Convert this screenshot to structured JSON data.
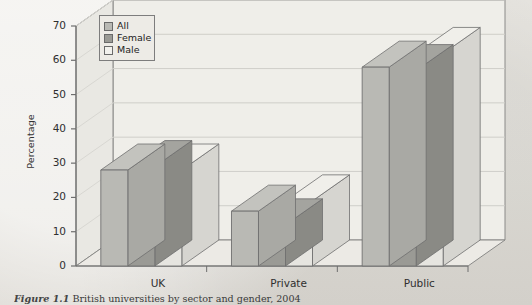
{
  "chart_data": {
    "type": "bar",
    "title": "",
    "xlabel": "",
    "ylabel": "Percentage",
    "categories": [
      "UK",
      "Private",
      "Public"
    ],
    "series": [
      {
        "name": "All",
        "values": [
          28,
          16,
          58
        ],
        "color": "#b9b9b4"
      },
      {
        "name": "Female",
        "values": [
          29,
          12,
          57
        ],
        "color": "#9a9a95"
      },
      {
        "name": "Male",
        "values": [
          28,
          19,
          62
        ],
        "color": "#e6e5e0"
      }
    ],
    "ylim": [
      0,
      70
    ],
    "yticks": [
      0,
      10,
      20,
      30,
      40,
      50,
      60,
      70
    ],
    "grid": true,
    "grid_axis": "y",
    "legend_position": "top-left",
    "style": "3d-extruded-bars"
  },
  "axis": {
    "y_label": "Percentage",
    "y_ticks": [
      "0",
      "10",
      "20",
      "30",
      "40",
      "50",
      "60",
      "70"
    ],
    "x_ticks": [
      "UK",
      "Private",
      "Public"
    ]
  },
  "legend": {
    "items": [
      {
        "label": "All",
        "swatch": "#b9b9b4"
      },
      {
        "label": "Female",
        "swatch": "#9a9a95"
      },
      {
        "label": "Male",
        "swatch": "#f2f1ed"
      }
    ]
  },
  "caption": {
    "figure_number": "Figure 1.1",
    "text": "British universities by sector and gender, 2004"
  },
  "colors": {
    "page_background": "#e6e4df",
    "plot_background": "#efeee9",
    "axis_line": "#6e6e6e",
    "grid_line": "#cfcec9",
    "bar_all": "#b9b9b4",
    "bar_female": "#9a9a95",
    "bar_male": "#e8e7e2"
  }
}
